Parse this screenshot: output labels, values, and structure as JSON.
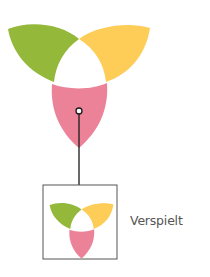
{
  "diagram": {
    "main_symbol": {
      "petals": [
        {
          "name": "green",
          "color": "#93b83a"
        },
        {
          "name": "yellow",
          "color": "#fdcd58"
        },
        {
          "name": "pink",
          "color": "#ec8298"
        }
      ]
    },
    "connector": {
      "color": "#1a1a1a"
    },
    "thumbnail": {
      "border_color": "#555555"
    },
    "label": "Verspielt"
  }
}
